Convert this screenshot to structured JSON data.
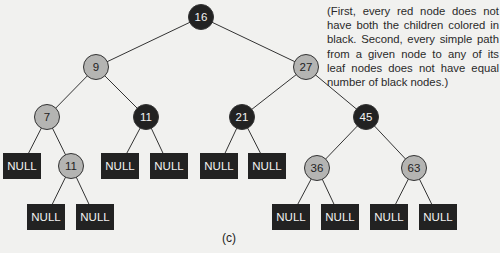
{
  "figure_label": "(c)",
  "caption": "(First, every red node does not have both the children colored in black. Second, every simple path from a given node to any of its leaf nodes does not have equal number of black nodes.)",
  "colors": {
    "black_node": "#222222",
    "red_node_gray": "#b4b4b2",
    "edge": "#333333",
    "background": "#f1f1ef"
  },
  "nodes": [
    {
      "id": "n16",
      "label": "16",
      "color": "black",
      "shape": "circle",
      "x": 201,
      "y": 17
    },
    {
      "id": "n9",
      "label": "9",
      "color": "gray",
      "shape": "circle",
      "x": 96,
      "y": 67
    },
    {
      "id": "n27",
      "label": "27",
      "color": "gray",
      "shape": "circle",
      "x": 306,
      "y": 67
    },
    {
      "id": "n7",
      "label": "7",
      "color": "gray",
      "shape": "circle",
      "x": 47,
      "y": 117
    },
    {
      "id": "n11a",
      "label": "11",
      "color": "black",
      "shape": "circle",
      "x": 146,
      "y": 117
    },
    {
      "id": "n21",
      "label": "21",
      "color": "black",
      "shape": "circle",
      "x": 242,
      "y": 117
    },
    {
      "id": "n45",
      "label": "45",
      "color": "black",
      "shape": "circle",
      "x": 366,
      "y": 117
    },
    {
      "id": "null1",
      "label": "NULL",
      "color": "black",
      "shape": "box",
      "x": 22,
      "y": 166
    },
    {
      "id": "n11b",
      "label": "11",
      "color": "gray",
      "shape": "circle",
      "x": 71,
      "y": 166
    },
    {
      "id": "null2",
      "label": "NULL",
      "color": "black",
      "shape": "box",
      "x": 120,
      "y": 166
    },
    {
      "id": "null3",
      "label": "NULL",
      "color": "black",
      "shape": "box",
      "x": 169,
      "y": 166
    },
    {
      "id": "null4",
      "label": "NULL",
      "color": "black",
      "shape": "box",
      "x": 219,
      "y": 166
    },
    {
      "id": "null5",
      "label": "NULL",
      "color": "black",
      "shape": "box",
      "x": 267,
      "y": 166
    },
    {
      "id": "n36",
      "label": "36",
      "color": "gray",
      "shape": "circle",
      "x": 317,
      "y": 168
    },
    {
      "id": "n63",
      "label": "63",
      "color": "gray",
      "shape": "circle",
      "x": 414,
      "y": 168
    },
    {
      "id": "null6",
      "label": "NULL",
      "color": "black",
      "shape": "box",
      "x": 46,
      "y": 217
    },
    {
      "id": "null7",
      "label": "NULL",
      "color": "black",
      "shape": "box",
      "x": 95,
      "y": 217
    },
    {
      "id": "null8",
      "label": "NULL",
      "color": "black",
      "shape": "box",
      "x": 291,
      "y": 217
    },
    {
      "id": "null9",
      "label": "NULL",
      "color": "black",
      "shape": "box",
      "x": 340,
      "y": 217
    },
    {
      "id": "null10",
      "label": "NULL",
      "color": "black",
      "shape": "box",
      "x": 389,
      "y": 217
    },
    {
      "id": "null11",
      "label": "NULL",
      "color": "black",
      "shape": "box",
      "x": 438,
      "y": 217
    }
  ],
  "edges": [
    [
      "n16",
      "n9"
    ],
    [
      "n16",
      "n27"
    ],
    [
      "n9",
      "n7"
    ],
    [
      "n9",
      "n11a"
    ],
    [
      "n27",
      "n21"
    ],
    [
      "n27",
      "n45"
    ],
    [
      "n7",
      "null1"
    ],
    [
      "n7",
      "n11b"
    ],
    [
      "n11a",
      "null2"
    ],
    [
      "n11a",
      "null3"
    ],
    [
      "n21",
      "null4"
    ],
    [
      "n21",
      "null5"
    ],
    [
      "n45",
      "n36"
    ],
    [
      "n45",
      "n63"
    ],
    [
      "n11b",
      "null6"
    ],
    [
      "n11b",
      "null7"
    ],
    [
      "n36",
      "null8"
    ],
    [
      "n36",
      "null9"
    ],
    [
      "n63",
      "null10"
    ],
    [
      "n63",
      "null11"
    ]
  ]
}
